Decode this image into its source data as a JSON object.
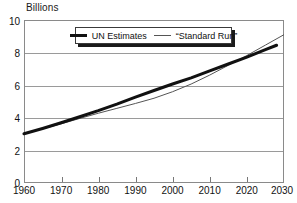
{
  "chart_data": {
    "type": "line",
    "title": "",
    "ylabel": "Billions",
    "xlabel": "",
    "xlim": [
      1960,
      2030
    ],
    "ylim": [
      0,
      10
    ],
    "grid": true,
    "legend_position": "top-center",
    "x_ticks": [
      1960,
      1970,
      1980,
      1990,
      2000,
      2010,
      2020,
      2030
    ],
    "y_ticks": [
      0,
      2,
      4,
      6,
      8,
      10
    ],
    "series": [
      {
        "name": "UN Estimates",
        "style": "thick-solid",
        "color": "#111111",
        "x": [
          1960,
          1965,
          1970,
          1975,
          1980,
          1985,
          1990,
          1995,
          2000,
          2005,
          2010,
          2015,
          2020,
          2025,
          2028
        ],
        "values": [
          3.02,
          3.35,
          3.7,
          4.07,
          4.44,
          4.84,
          5.27,
          5.68,
          6.07,
          6.45,
          6.88,
          7.3,
          7.72,
          8.18,
          8.45
        ]
      },
      {
        "name": "“Standard Run”",
        "style": "thin-solid",
        "color": "#555555",
        "x": [
          1960,
          1965,
          1970,
          1975,
          1980,
          1985,
          1990,
          1995,
          2000,
          2005,
          2010,
          2015,
          2020,
          2025,
          2030
        ],
        "values": [
          3.02,
          3.32,
          3.63,
          3.96,
          4.28,
          4.58,
          4.88,
          5.2,
          5.6,
          6.07,
          6.62,
          7.22,
          7.82,
          8.46,
          9.1
        ]
      }
    ]
  },
  "axis": {
    "y_title": "Billions",
    "y_labels": [
      "10",
      "8",
      "6",
      "4",
      "2",
      "0"
    ],
    "x_labels": [
      "1960",
      "1970",
      "1980",
      "1990",
      "2000",
      "2010",
      "2020",
      "2030"
    ]
  },
  "legend": {
    "entries": [
      {
        "label": "UN Estimates",
        "marker": "thick-line-swatch"
      },
      {
        "label": "“Standard Run”",
        "marker": "thin-line-swatch"
      }
    ]
  }
}
